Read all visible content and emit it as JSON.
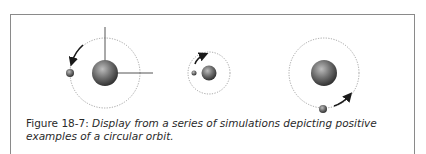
{
  "figure": {
    "label": "Figure 18-7:",
    "caption": "Display from a series of simulations depicting positive examples of a circular orbit."
  },
  "panels": [
    {
      "name": "simulation-1",
      "star_cx": 105,
      "star_cy": 73,
      "star_r": 13,
      "orbit_r": 35,
      "planet_cx": 70,
      "planet_cy": 73,
      "planet_r": 4,
      "axes": true,
      "arrow": "upper-left-counterclockwise"
    },
    {
      "name": "simulation-2",
      "star_cx": 209,
      "star_cy": 73,
      "star_r": 7,
      "orbit_r": 21,
      "planet_cx": 194,
      "planet_cy": 73,
      "planet_r": 2.5,
      "axes": false,
      "arrow": "upper-left-clockwise"
    },
    {
      "name": "simulation-3",
      "star_cx": 324,
      "star_cy": 73,
      "star_r": 13,
      "orbit_r": 35,
      "planet_cx": 323,
      "planet_cy": 109,
      "planet_r": 4,
      "axes": false,
      "arrow": "lower-right-counterclockwise"
    }
  ],
  "colors": {
    "frame": "#8a8a8a",
    "orbit": "#8c8c8c",
    "star_light": "#b5b5b5",
    "star_dark": "#3a3a3a",
    "axes": "#555555",
    "arrow": "#1a1a1a",
    "caption": "#2a2a2a"
  }
}
